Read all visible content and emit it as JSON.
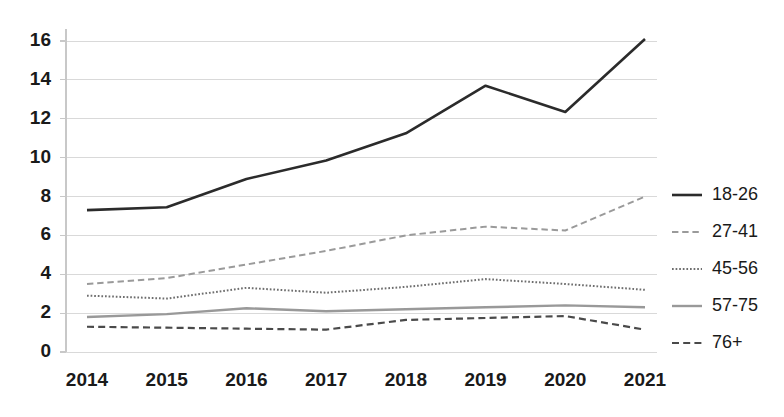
{
  "chart_data": {
    "type": "line",
    "title": "",
    "subtitle": "",
    "xlabel": "",
    "ylabel": "",
    "categories": [
      "2014",
      "2015",
      "2016",
      "2017",
      "2018",
      "2019",
      "2020",
      "2021"
    ],
    "x": [
      2014,
      2015,
      2016,
      2017,
      2018,
      2019,
      2020,
      2021
    ],
    "xlim": [
      2014,
      2021
    ],
    "ylim": [
      0,
      16
    ],
    "yticks": [
      0,
      2,
      4,
      6,
      8,
      10,
      12,
      14,
      16
    ],
    "ytick_labels": [
      "0",
      "2",
      "4",
      "6",
      "8",
      "10",
      "12",
      "14",
      "16"
    ],
    "grid": true,
    "grid_axis": "y",
    "legend_position": "right",
    "series": [
      {
        "name": "18-26",
        "values": [
          7.3,
          7.45,
          8.9,
          9.85,
          11.25,
          13.7,
          12.35,
          16.1
        ],
        "color": "#2b2b2b",
        "style": "solid",
        "width": 2.6
      },
      {
        "name": "27-41",
        "values": [
          3.5,
          3.8,
          4.5,
          5.2,
          6.0,
          6.45,
          6.25,
          8.0
        ],
        "color": "#9a9a9a",
        "style": "dashed",
        "width": 2.0
      },
      {
        "name": "45-56",
        "values": [
          2.9,
          2.75,
          3.3,
          3.05,
          3.35,
          3.75,
          3.5,
          3.2
        ],
        "color": "#6e6e6e",
        "style": "dotted",
        "width": 2.0
      },
      {
        "name": "57-75",
        "values": [
          1.8,
          1.95,
          2.25,
          2.1,
          2.2,
          2.3,
          2.4,
          2.3
        ],
        "color": "#999999",
        "style": "solid",
        "width": 2.4
      },
      {
        "name": "76+",
        "values": [
          1.3,
          1.25,
          1.2,
          1.15,
          1.65,
          1.75,
          1.85,
          1.15
        ],
        "color": "#4a4a4a",
        "style": "dashed",
        "width": 2.2
      }
    ]
  },
  "axes": {
    "y_tick_labels": [
      "16",
      "14",
      "12",
      "10",
      "8",
      "6",
      "4",
      "2",
      "0"
    ],
    "x_tick_labels": [
      "2014",
      "2015",
      "2016",
      "2017",
      "2018",
      "2019",
      "2020",
      "2021"
    ]
  },
  "legend": {
    "entries": [
      {
        "label": "18-26"
      },
      {
        "label": "27-41"
      },
      {
        "label": "45-56"
      },
      {
        "label": "57-75"
      },
      {
        "label": "76+"
      }
    ]
  },
  "colors": {
    "background": "#ffffff",
    "gridline": "#d9d9d9",
    "axis": "#c8c8c8",
    "text": "#1a1a1a"
  }
}
